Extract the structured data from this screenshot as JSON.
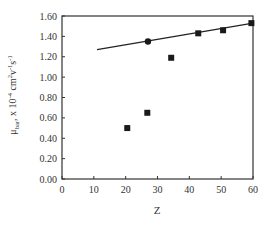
{
  "chart_data": {
    "type": "scatter",
    "title": "",
    "xlabel": "Z",
    "ylabel": "μbar, x 10-4 cm2v-1s-1",
    "ylabel_parts": {
      "mu": "μ",
      "sub": "bar",
      "rest": ", x 10",
      "exp1": "-4",
      "unit1": " cm",
      "exp2": "2",
      "unit2": "v",
      "exp3": "-1",
      "unit3": "s",
      "exp4": "-1"
    },
    "xlim": [
      0,
      60
    ],
    "ylim": [
      0.0,
      1.6
    ],
    "xticks": [
      "0",
      "10",
      "20",
      "30",
      "40",
      "50",
      "60"
    ],
    "yticks": [
      "0.00",
      "0.20",
      "0.40",
      "0.60",
      "0.80",
      "1.00",
      "1.20",
      "1.40",
      "1.60"
    ],
    "grid": false,
    "legend": null,
    "series": [
      {
        "name": "squares",
        "marker": "square",
        "x": [
          20.5,
          26.8,
          34.3,
          42.8,
          50.6,
          59.5
        ],
        "y": [
          0.5,
          0.65,
          1.19,
          1.43,
          1.46,
          1.53
        ]
      },
      {
        "name": "circle",
        "marker": "circle",
        "x": [
          27.0
        ],
        "y": [
          1.35
        ]
      },
      {
        "name": "fit-line",
        "marker": "line",
        "x": [
          11,
          60
        ],
        "y": [
          1.27,
          1.53
        ]
      }
    ]
  }
}
